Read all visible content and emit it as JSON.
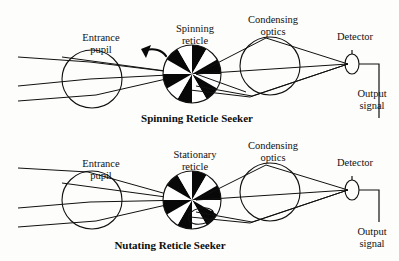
{
  "figure": {
    "type": "diagram",
    "background_color": "#fdfdfb",
    "ink_color": "#111111"
  },
  "panels": [
    {
      "id": "spinning",
      "caption": "Spinning Reticle Seeker",
      "labels": {
        "entrance_pupil": "Entrance\npupil",
        "entrance_pupil_line1": "Entrance",
        "entrance_pupil_line2": "pupil",
        "reticle_line1": "Spinning",
        "reticle_line2": "reticle",
        "condensing_line1": "Condensing",
        "condensing_line2": "optics",
        "detector": "Detector",
        "output_line1": "Output",
        "output_line2": "signal"
      },
      "motion_indicator": "rotation-arrow",
      "reticle": {
        "spokes": 12,
        "pattern": "alternating black and white pie wedges",
        "center_x": 192,
        "center_y": 74,
        "radius": 29
      }
    },
    {
      "id": "nutating",
      "caption": "Nutating Reticle Seeker",
      "labels": {
        "entrance_pupil_line1": "Entrance",
        "entrance_pupil_line2": "pupil",
        "reticle_line1": "Stationary",
        "reticle_line2": "reticle",
        "condensing_line1": "Condensing",
        "condensing_line2": "optics",
        "detector": "Detector",
        "output_line1": "Output",
        "output_line2": "signal"
      },
      "motion_indicator": "nutation-circle-arrow",
      "reticle": {
        "spokes": 12,
        "pattern": "alternating black and white pie wedges",
        "center_x": 192,
        "center_y": 200,
        "radius": 29
      }
    }
  ],
  "components": {
    "entrance_pupil_name": "entrance-pupil-lens",
    "reticle_name": "reticle-wheel",
    "condensing_optics_name": "condensing-lens",
    "detector_name": "detector-element",
    "output_wire_name": "output-signal-wire"
  }
}
